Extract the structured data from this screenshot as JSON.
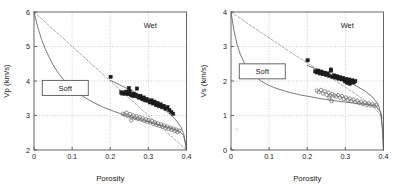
{
  "figure": {
    "background": "#ffffff",
    "panel_count": 2,
    "frame_color": "#555555",
    "grid_color": "#b9b9b9",
    "solid_curve_color": "#6b6b6b",
    "dashed_curve_color": "#9a9a9a",
    "square_marker_color": "#1c1c1c",
    "circle_marker_color": "#6f6f6f"
  },
  "chart_data": [
    {
      "type": "scatter",
      "panel": "left",
      "title": "",
      "xlabel": "Porosity",
      "ylabel": "Vp (km/s)",
      "xlim": [
        0,
        0.4
      ],
      "ylim": [
        2,
        6
      ],
      "xticks": [
        0,
        0.1,
        0.2,
        0.3,
        0.4
      ],
      "xticklabels": [
        "0",
        "0.1",
        "0.2",
        "0.3",
        "0.4"
      ],
      "yticks": [
        2,
        3,
        4,
        5,
        6
      ],
      "yticklabels": [
        "2",
        "3",
        "4",
        "5",
        "6"
      ],
      "grid": true,
      "annotations": [
        {
          "text": "Wet",
          "x": 0.305,
          "y": 5.62,
          "boxed": false
        },
        {
          "text": "Soft",
          "x": 0.082,
          "y": 3.8,
          "boxed": true
        }
      ],
      "curves": [
        {
          "name": "upper-bound-dashed",
          "style": "dashed",
          "color": "#9a9a9a",
          "points": [
            [
              0,
              6.0
            ],
            [
              0.05,
              5.5
            ],
            [
              0.1,
              5.0
            ],
            [
              0.15,
              4.5
            ],
            [
              0.2,
              4.0
            ],
            [
              0.25,
              3.5
            ],
            [
              0.3,
              3.0
            ],
            [
              0.35,
              2.5
            ],
            [
              0.4,
              2.0
            ]
          ]
        },
        {
          "name": "soft-sediment-lower-curve",
          "style": "solid",
          "color": "#6b6b6b",
          "points": [
            [
              0,
              6.0
            ],
            [
              0.01,
              5.55
            ],
            [
              0.02,
              5.2
            ],
            [
              0.03,
              4.92
            ],
            [
              0.04,
              4.68
            ],
            [
              0.05,
              4.47
            ],
            [
              0.06,
              4.29
            ],
            [
              0.08,
              4.0
            ],
            [
              0.1,
              3.78
            ],
            [
              0.12,
              3.61
            ],
            [
              0.15,
              3.41
            ],
            [
              0.18,
              3.25
            ],
            [
              0.21,
              3.12
            ],
            [
              0.24,
              3.0
            ],
            [
              0.27,
              2.9
            ],
            [
              0.3,
              2.81
            ],
            [
              0.33,
              2.72
            ],
            [
              0.36,
              2.63
            ],
            [
              0.38,
              2.55
            ],
            [
              0.392,
              2.42
            ],
            [
              0.397,
              2.2
            ],
            [
              0.4,
              2.0
            ]
          ]
        },
        {
          "name": "stiff-sediment-upper-curve",
          "style": "solid",
          "color": "#6b6b6b",
          "points": [
            [
              0.2,
              4.02
            ],
            [
              0.23,
              3.86
            ],
            [
              0.26,
              3.7
            ],
            [
              0.29,
              3.52
            ],
            [
              0.32,
              3.33
            ],
            [
              0.35,
              3.1
            ],
            [
              0.37,
              2.9
            ],
            [
              0.385,
              2.68
            ],
            [
              0.394,
              2.42
            ],
            [
              0.4,
              2.0
            ]
          ]
        }
      ],
      "series": [
        {
          "name": "squares",
          "marker": "filled-square",
          "color": "#1c1c1c",
          "points": [
            [
              0.201,
              4.12
            ],
            [
              0.229,
              3.67
            ],
            [
              0.232,
              3.64
            ],
            [
              0.236,
              3.66
            ],
            [
              0.239,
              3.63
            ],
            [
              0.242,
              3.69
            ],
            [
              0.245,
              3.65
            ],
            [
              0.248,
              3.62
            ],
            [
              0.251,
              3.7
            ],
            [
              0.254,
              3.6
            ],
            [
              0.249,
              3.8
            ],
            [
              0.258,
              3.58
            ],
            [
              0.261,
              3.63
            ],
            [
              0.264,
              3.56
            ],
            [
              0.267,
              3.6
            ],
            [
              0.27,
              3.78
            ],
            [
              0.273,
              3.55
            ],
            [
              0.276,
              3.52
            ],
            [
              0.279,
              3.57
            ],
            [
              0.282,
              3.5
            ],
            [
              0.285,
              3.47
            ],
            [
              0.288,
              3.52
            ],
            [
              0.292,
              3.44
            ],
            [
              0.296,
              3.48
            ],
            [
              0.3,
              3.42
            ],
            [
              0.304,
              3.38
            ],
            [
              0.308,
              3.44
            ],
            [
              0.312,
              3.35
            ],
            [
              0.316,
              3.4
            ],
            [
              0.32,
              3.3
            ],
            [
              0.324,
              3.36
            ],
            [
              0.328,
              3.27
            ],
            [
              0.332,
              3.32
            ],
            [
              0.336,
              3.24
            ],
            [
              0.34,
              3.28
            ],
            [
              0.345,
              3.2
            ],
            [
              0.35,
              3.24
            ],
            [
              0.355,
              3.16
            ],
            [
              0.36,
              3.1
            ],
            [
              0.365,
              3.05
            ]
          ]
        },
        {
          "name": "circles",
          "marker": "open-circle",
          "color": "#6f6f6f",
          "points": [
            [
              0.233,
              3.05
            ],
            [
              0.238,
              3.02
            ],
            [
              0.243,
              3.08
            ],
            [
              0.247,
              2.98
            ],
            [
              0.252,
              3.04
            ],
            [
              0.256,
              2.95
            ],
            [
              0.26,
              3.0
            ],
            [
              0.255,
              2.86
            ],
            [
              0.265,
              2.93
            ],
            [
              0.269,
              2.98
            ],
            [
              0.273,
              2.9
            ],
            [
              0.277,
              2.95
            ],
            [
              0.281,
              2.88
            ],
            [
              0.285,
              2.92
            ],
            [
              0.289,
              2.85
            ],
            [
              0.293,
              2.89
            ],
            [
              0.297,
              2.82
            ],
            [
              0.301,
              2.86
            ],
            [
              0.305,
              2.8
            ],
            [
              0.309,
              2.84
            ],
            [
              0.313,
              2.76
            ],
            [
              0.317,
              2.8
            ],
            [
              0.321,
              2.73
            ],
            [
              0.325,
              2.77
            ],
            [
              0.329,
              2.7
            ],
            [
              0.333,
              2.74
            ],
            [
              0.337,
              2.67
            ],
            [
              0.341,
              2.71
            ],
            [
              0.345,
              2.64
            ],
            [
              0.349,
              2.68
            ],
            [
              0.353,
              2.61
            ],
            [
              0.357,
              2.65
            ],
            [
              0.361,
              2.58
            ],
            [
              0.365,
              2.62
            ],
            [
              0.369,
              2.55
            ],
            [
              0.373,
              2.59
            ],
            [
              0.377,
              2.52
            ],
            [
              0.381,
              2.56
            ]
          ]
        }
      ]
    },
    {
      "type": "scatter",
      "panel": "right",
      "title": "",
      "xlabel": "Porosity",
      "ylabel": "Vs (km/s)",
      "xlim": [
        0,
        0.4
      ],
      "ylim": [
        0,
        4
      ],
      "xticks": [
        0,
        0.1,
        0.2,
        0.3,
        0.4
      ],
      "xticklabels": [
        "0",
        "0.1",
        "0.2",
        "0.3",
        "0.4"
      ],
      "yticks": [
        0,
        1,
        2,
        3,
        4
      ],
      "yticklabels": [
        "0",
        "1",
        "2",
        "3",
        "4"
      ],
      "grid": true,
      "annotations": [
        {
          "text": "Wet",
          "x": 0.305,
          "y": 3.62,
          "boxed": false
        },
        {
          "text": "Soft",
          "x": 0.082,
          "y": 2.28,
          "boxed": true
        }
      ],
      "curves": [
        {
          "name": "upper-bound-dashed",
          "style": "dashed",
          "color": "#9a9a9a",
          "points": [
            [
              0,
              4.0
            ],
            [
              0.05,
              3.62
            ],
            [
              0.1,
              3.25
            ],
            [
              0.15,
              2.88
            ],
            [
              0.2,
              2.52
            ],
            [
              0.25,
              2.18
            ],
            [
              0.3,
              1.82
            ],
            [
              0.35,
              1.45
            ],
            [
              0.38,
              1.18
            ],
            [
              0.4,
              0.9
            ]
          ]
        },
        {
          "name": "soft-sediment-lower-curve",
          "style": "solid",
          "color": "#6b6b6b",
          "points": [
            [
              0,
              4.0
            ],
            [
              0.008,
              3.45
            ],
            [
              0.016,
              3.05
            ],
            [
              0.025,
              2.76
            ],
            [
              0.035,
              2.52
            ],
            [
              0.045,
              2.35
            ],
            [
              0.06,
              2.16
            ],
            [
              0.08,
              1.99
            ],
            [
              0.1,
              1.87
            ],
            [
              0.12,
              1.78
            ],
            [
              0.15,
              1.68
            ],
            [
              0.18,
              1.6
            ],
            [
              0.21,
              1.54
            ],
            [
              0.24,
              1.48
            ],
            [
              0.27,
              1.43
            ],
            [
              0.3,
              1.39
            ],
            [
              0.33,
              1.35
            ],
            [
              0.36,
              1.31
            ],
            [
              0.38,
              1.27
            ],
            [
              0.392,
              1.1
            ],
            [
              0.397,
              0.62
            ],
            [
              0.4,
              0.0
            ]
          ]
        },
        {
          "name": "stiff-sediment-upper-curve",
          "style": "solid",
          "color": "#6b6b6b",
          "points": [
            [
              0.2,
              2.45
            ],
            [
              0.23,
              2.32
            ],
            [
              0.26,
              2.2
            ],
            [
              0.29,
              2.06
            ],
            [
              0.32,
              1.91
            ],
            [
              0.35,
              1.72
            ],
            [
              0.37,
              1.55
            ],
            [
              0.385,
              1.34
            ],
            [
              0.394,
              1.05
            ],
            [
              0.398,
              0.55
            ],
            [
              0.4,
              0.0
            ]
          ]
        }
      ],
      "series": [
        {
          "name": "squares",
          "marker": "filled-square",
          "color": "#1c1c1c",
          "points": [
            [
              0.201,
              2.6
            ],
            [
              0.221,
              2.28
            ],
            [
              0.225,
              2.25
            ],
            [
              0.229,
              2.3
            ],
            [
              0.233,
              2.22
            ],
            [
              0.237,
              2.27
            ],
            [
              0.241,
              2.2
            ],
            [
              0.245,
              2.24
            ],
            [
              0.249,
              2.18
            ],
            [
              0.253,
              2.22
            ],
            [
              0.257,
              2.15
            ],
            [
              0.262,
              2.3
            ],
            [
              0.266,
              2.12
            ],
            [
              0.27,
              2.16
            ],
            [
              0.262,
              2.33
            ],
            [
              0.274,
              2.1
            ],
            [
              0.278,
              2.14
            ],
            [
              0.282,
              2.07
            ],
            [
              0.286,
              2.11
            ],
            [
              0.29,
              2.05
            ],
            [
              0.294,
              2.09
            ],
            [
              0.298,
              2.02
            ],
            [
              0.302,
              2.06
            ],
            [
              0.306,
              2.0
            ],
            [
              0.31,
              2.04
            ],
            [
              0.314,
              1.98
            ],
            [
              0.318,
              2.02
            ],
            [
              0.322,
              1.96
            ],
            [
              0.326,
              2.0
            ],
            [
              0.3,
              1.99
            ],
            [
              0.304,
              1.96
            ],
            [
              0.308,
              1.94
            ],
            [
              0.312,
              1.92
            ]
          ]
        },
        {
          "name": "circles",
          "marker": "open-circle",
          "color": "#6f6f6f",
          "points": [
            [
              0.225,
              1.72
            ],
            [
              0.23,
              1.68
            ],
            [
              0.236,
              1.74
            ],
            [
              0.241,
              1.64
            ],
            [
              0.246,
              1.7
            ],
            [
              0.251,
              1.6
            ],
            [
              0.256,
              1.66
            ],
            [
              0.261,
              1.57
            ],
            [
              0.266,
              1.62
            ],
            [
              0.258,
              1.52
            ],
            [
              0.271,
              1.58
            ],
            [
              0.264,
              1.42
            ],
            [
              0.276,
              1.55
            ],
            [
              0.281,
              1.59
            ],
            [
              0.286,
              1.52
            ],
            [
              0.291,
              1.56
            ],
            [
              0.296,
              1.48
            ],
            [
              0.301,
              1.52
            ],
            [
              0.306,
              1.45
            ],
            [
              0.311,
              1.49
            ],
            [
              0.316,
              1.42
            ],
            [
              0.321,
              1.46
            ],
            [
              0.326,
              1.39
            ],
            [
              0.331,
              1.43
            ],
            [
              0.336,
              1.36
            ],
            [
              0.341,
              1.4
            ],
            [
              0.346,
              1.33
            ],
            [
              0.351,
              1.37
            ],
            [
              0.356,
              1.31
            ],
            [
              0.361,
              1.35
            ],
            [
              0.366,
              1.29
            ],
            [
              0.371,
              1.33
            ],
            [
              0.376,
              1.28
            ],
            [
              0.381,
              1.31
            ]
          ]
        }
      ],
      "stray_marks": [
        {
          "x": 0.015,
          "y": 0.6
        }
      ]
    }
  ]
}
